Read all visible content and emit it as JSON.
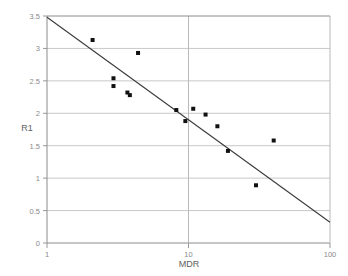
{
  "chart_data": {
    "type": "scatter",
    "title": "",
    "xlabel": "MDR",
    "ylabel": "R1",
    "xscale": "log",
    "yscale": "linear",
    "xlim": [
      1,
      100
    ],
    "ylim": [
      0,
      3.5
    ],
    "grid": true,
    "grid_axis": "y",
    "legend": null,
    "x_ticks": [
      1,
      10,
      100
    ],
    "x_tick_labels": [
      "1",
      "10",
      "100"
    ],
    "y_ticks": [
      0,
      0.5,
      1,
      1.5,
      2,
      2.5,
      3,
      3.5
    ],
    "y_tick_labels": [
      "0",
      "0.5",
      "1",
      "1.5",
      "2",
      "2.5",
      "3",
      "3.5"
    ],
    "points": [
      {
        "x": 2.1,
        "y": 3.13
      },
      {
        "x": 4.4,
        "y": 2.93
      },
      {
        "x": 2.95,
        "y": 2.54
      },
      {
        "x": 2.95,
        "y": 2.42
      },
      {
        "x": 3.7,
        "y": 2.32
      },
      {
        "x": 3.85,
        "y": 2.28
      },
      {
        "x": 8.2,
        "y": 2.05
      },
      {
        "x": 10.8,
        "y": 2.07
      },
      {
        "x": 9.5,
        "y": 1.88
      },
      {
        "x": 13.2,
        "y": 1.98
      },
      {
        "x": 16.0,
        "y": 1.8
      },
      {
        "x": 19.0,
        "y": 1.42
      },
      {
        "x": 40.0,
        "y": 1.58
      },
      {
        "x": 30.0,
        "y": 0.89
      }
    ],
    "marker": {
      "shape": "square",
      "color": "#111111",
      "size": 4
    },
    "trendline": {
      "type": "linear-in-log-x",
      "x_start": 1,
      "y_start": 3.48,
      "x_end": 100,
      "y_end": 0.32,
      "color": "#3a3a3a"
    }
  },
  "axes": {
    "x_axis_name": "MDR",
    "y_axis_name": "R1"
  }
}
